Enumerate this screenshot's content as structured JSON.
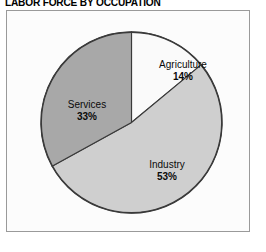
{
  "title": "LABOR FORCE BY OCCUPATION",
  "chart_data": {
    "type": "pie",
    "title": "LABOR FORCE BY OCCUPATION",
    "xlabel": "",
    "ylabel": "",
    "legend": "none",
    "grid": false,
    "total_percent": 100,
    "start_angle_deg": 0,
    "direction": "clockwise",
    "categories": [
      "Agriculture",
      "Industry",
      "Services"
    ],
    "values": [
      14,
      53,
      33
    ],
    "unit": "%",
    "slices": [
      {
        "label": "Agriculture",
        "value": 14,
        "value_text": "14%",
        "color": "#fafafa",
        "edge_color": "#3a3a3a"
      },
      {
        "label": "Industry",
        "value": 53,
        "value_text": "53%",
        "color": "#cfcfcf",
        "edge_color": "#3a3a3a"
      },
      {
        "label": "Services",
        "value": 33,
        "value_text": "33%",
        "color": "#a8a8a8",
        "edge_color": "#3a3a3a"
      }
    ]
  },
  "frame": {
    "background": "#fcfcfc",
    "border_color": "#9a9a9a"
  }
}
